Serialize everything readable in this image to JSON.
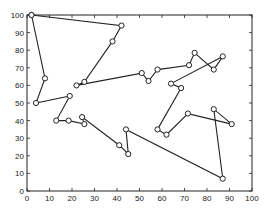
{
  "chart_data": {
    "type": "line",
    "title": "",
    "xlabel": "",
    "ylabel": "",
    "xlim": [
      0,
      100
    ],
    "ylim": [
      0,
      100
    ],
    "grid": false,
    "legend": null,
    "marker": "circle",
    "xticks": [
      0,
      10,
      20,
      30,
      40,
      50,
      60,
      70,
      80,
      90,
      100
    ],
    "yticks": [
      0,
      10,
      20,
      30,
      40,
      50,
      60,
      70,
      80,
      90,
      100
    ],
    "series": [
      {
        "name": "tour",
        "points": [
          [
            2,
            100
          ],
          [
            42,
            94
          ],
          [
            38,
            85
          ],
          [
            25.5,
            62
          ],
          [
            22,
            60
          ],
          [
            51,
            67
          ],
          [
            54,
            62.5
          ],
          [
            58,
            69
          ],
          [
            72,
            71.5
          ],
          [
            74.5,
            78.5
          ],
          [
            83,
            69
          ],
          [
            87,
            76.5
          ],
          [
            64,
            61
          ],
          [
            68.5,
            58.5
          ],
          [
            58,
            35
          ],
          [
            62,
            32
          ],
          [
            71.5,
            44
          ],
          [
            91,
            38
          ],
          [
            83,
            46.5
          ],
          [
            87,
            7
          ],
          [
            44,
            35
          ],
          [
            45,
            21
          ],
          [
            41,
            26
          ],
          [
            24.5,
            42
          ],
          [
            25.5,
            38
          ],
          [
            18.5,
            40
          ],
          [
            13,
            40
          ],
          [
            19,
            54
          ],
          [
            4,
            50
          ],
          [
            8,
            64
          ],
          [
            2,
            100
          ]
        ]
      }
    ]
  },
  "colors": {
    "line": "#222222",
    "axis": "#222222",
    "background": "#ffffff"
  }
}
